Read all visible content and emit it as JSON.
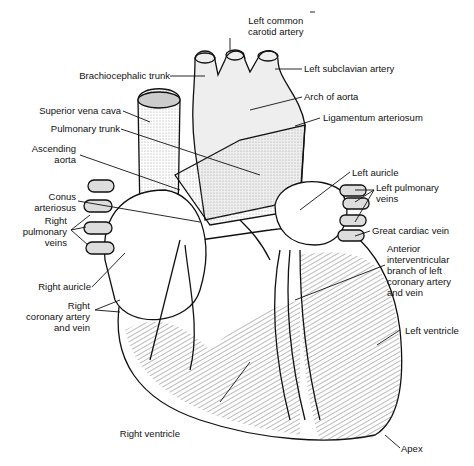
{
  "diagram": {
    "colors": {
      "line": "#111111",
      "shade": "#9a9a9a",
      "background": "#ffffff"
    },
    "labels": {
      "left_common_carotid": [
        "Left common",
        "carotid artery"
      ],
      "brachiocephalic_trunk": "Brachiocephalic trunk",
      "left_subclavian": "Left subclavian artery",
      "arch_of_aorta": "Arch of aorta",
      "ligamentum_arteriosum": "Ligamentum arteriosum",
      "superior_vena_cava": "Superior vena cava",
      "pulmonary_trunk": "Pulmonary trunk",
      "ascending_aorta": [
        "Ascending",
        "aorta"
      ],
      "left_auricle": "Left auricle",
      "left_pulmonary_veins": [
        "Left pulmonary",
        "veins"
      ],
      "conus_arteriosus": [
        "Conus",
        "arteriosus"
      ],
      "right_pulmonary_veins": [
        "Right",
        "pulmonary",
        "veins"
      ],
      "great_cardiac_vein": "Great cardiac vein",
      "anterior_interventricular": [
        "Anterior",
        "interventricular",
        "branch of left",
        "coronary artery",
        "and vein"
      ],
      "right_auricle": "Right auricle",
      "right_coronary": [
        "Right",
        "coronary artery",
        "and vein"
      ],
      "left_ventricle": "Left ventricle",
      "right_ventricle": "Right ventricle",
      "apex": "Apex"
    }
  }
}
